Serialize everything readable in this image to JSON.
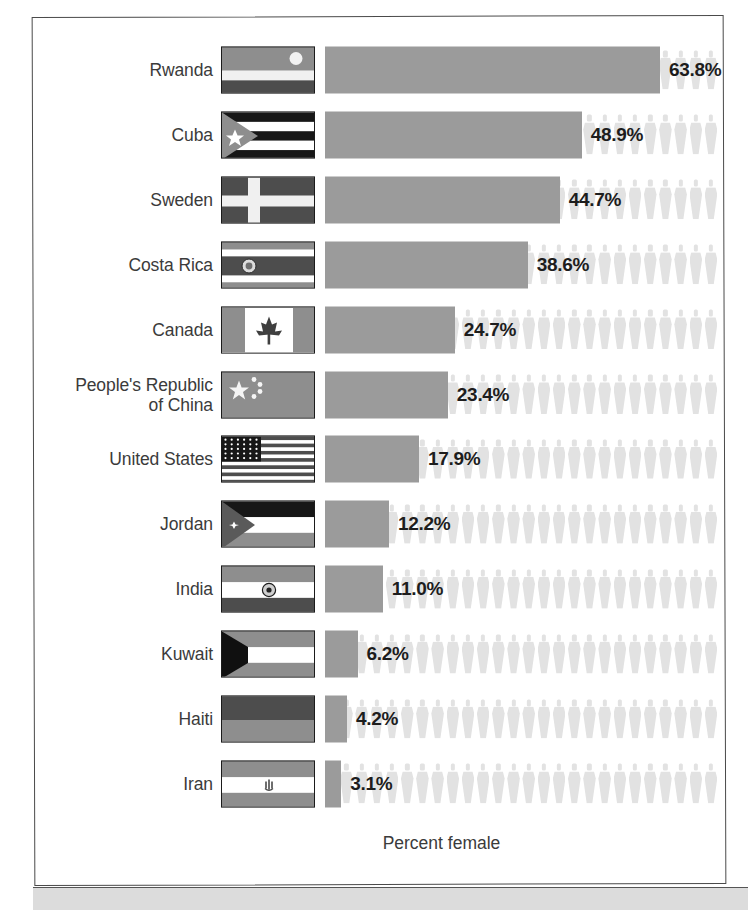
{
  "chart_data": {
    "type": "bar",
    "orientation": "horizontal",
    "title": "",
    "xlabel": "Percent female",
    "ylabel": "",
    "xlim": [
      0,
      100
    ],
    "grid": false,
    "legend": null,
    "unit": "%",
    "value_suffix": "%",
    "icon_motif": "person-silhouette",
    "categories": [
      "Rwanda",
      "Cuba",
      "Sweden",
      "Costa Rica",
      "Canada",
      "People's Republic of China",
      "United States",
      "Jordan",
      "India",
      "Kuwait",
      "Haiti",
      "Iran"
    ],
    "values": [
      63.8,
      48.9,
      44.7,
      38.6,
      24.7,
      23.4,
      17.9,
      12.2,
      11.0,
      6.2,
      4.2,
      3.1
    ],
    "value_labels": [
      "63.8%",
      "48.9%",
      "44.7%",
      "38.6%",
      "24.7%",
      "23.4%",
      "17.9%",
      "12.2%",
      "11.0%",
      "6.2%",
      "4.2%",
      "3.1%"
    ]
  },
  "colors": {
    "bar": "#9b9b9b",
    "person_icon": "#e2e2e2",
    "label_text": "#3b3b3b",
    "value_text": "#1d1d1d",
    "frame": "#4a4a4a",
    "page_background": "#ffffff",
    "bottom_strip": "#dcdcdc"
  },
  "rows": [
    {
      "country": "Rwanda",
      "country_line1": "Rwanda",
      "country_line2": "",
      "value": 63.8,
      "value_label": "63.8%",
      "flag": "flag-rwanda"
    },
    {
      "country": "Cuba",
      "country_line1": "Cuba",
      "country_line2": "",
      "value": 48.9,
      "value_label": "48.9%",
      "flag": "flag-cuba"
    },
    {
      "country": "Sweden",
      "country_line1": "Sweden",
      "country_line2": "",
      "value": 44.7,
      "value_label": "44.7%",
      "flag": "flag-sweden"
    },
    {
      "country": "Costa Rica",
      "country_line1": "Costa Rica",
      "country_line2": "",
      "value": 38.6,
      "value_label": "38.6%",
      "flag": "flag-costa-rica"
    },
    {
      "country": "Canada",
      "country_line1": "Canada",
      "country_line2": "",
      "value": 24.7,
      "value_label": "24.7%",
      "flag": "flag-canada"
    },
    {
      "country": "People's Republic of China",
      "country_line1": "People's Republic",
      "country_line2": "of China",
      "value": 23.4,
      "value_label": "23.4%",
      "flag": "flag-china"
    },
    {
      "country": "United States",
      "country_line1": "United States",
      "country_line2": "",
      "value": 17.9,
      "value_label": "17.9%",
      "flag": "flag-united-states"
    },
    {
      "country": "Jordan",
      "country_line1": "Jordan",
      "country_line2": "",
      "value": 12.2,
      "value_label": "12.2%",
      "flag": "flag-jordan"
    },
    {
      "country": "India",
      "country_line1": "India",
      "country_line2": "",
      "value": 11.0,
      "value_label": "11.0%",
      "flag": "flag-india"
    },
    {
      "country": "Kuwait",
      "country_line1": "Kuwait",
      "country_line2": "",
      "value": 6.2,
      "value_label": "6.2%",
      "flag": "flag-kuwait"
    },
    {
      "country": "Haiti",
      "country_line1": "Haiti",
      "country_line2": "",
      "value": 4.2,
      "value_label": "4.2%",
      "flag": "flag-haiti"
    },
    {
      "country": "Iran",
      "country_line1": "Iran",
      "country_line2": "",
      "value": 3.1,
      "value_label": "3.1%",
      "flag": "flag-iran"
    }
  ],
  "axis": {
    "caption": "Percent female"
  }
}
